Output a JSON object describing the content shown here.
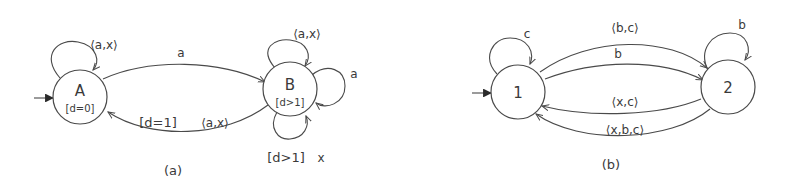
{
  "diagrams": [
    {
      "id": "a",
      "caption": "(a)",
      "states": [
        {
          "id": "A",
          "name": "A",
          "guard": "[d=0]",
          "initial": true
        },
        {
          "id": "B",
          "name": "B",
          "guard": "[d>1]",
          "initial": false
        }
      ],
      "transitions": [
        {
          "from": "A",
          "to": "A",
          "label": "⟨a,x⟩"
        },
        {
          "from": "A",
          "to": "B",
          "label": "a"
        },
        {
          "from": "B",
          "to": "B",
          "label": "⟨a,x⟩",
          "position": "top"
        },
        {
          "from": "B",
          "to": "B",
          "label": "a",
          "position": "right"
        },
        {
          "from": "B",
          "to": "B",
          "guard": "[d>1]",
          "label": "x",
          "position": "bottom"
        },
        {
          "from": "B",
          "to": "A",
          "guard": "[d=1]",
          "label": "⟨a,x⟩"
        }
      ]
    },
    {
      "id": "b",
      "caption": "(b)",
      "states": [
        {
          "id": "1",
          "name": "1",
          "initial": true
        },
        {
          "id": "2",
          "name": "2",
          "initial": false
        }
      ],
      "transitions": [
        {
          "from": "1",
          "to": "1",
          "label": "c"
        },
        {
          "from": "2",
          "to": "2",
          "label": "b"
        },
        {
          "from": "1",
          "to": "2",
          "label": "⟨b,c⟩"
        },
        {
          "from": "1",
          "to": "2",
          "label": "b"
        },
        {
          "from": "2",
          "to": "1",
          "label": "⟨x,c⟩"
        },
        {
          "from": "2",
          "to": "1",
          "label": "⟨x,b,c⟩"
        }
      ]
    }
  ]
}
